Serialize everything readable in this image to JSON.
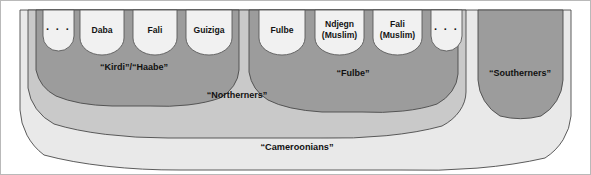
{
  "figure": {
    "kind": "nested-ethnic-identity-diagram",
    "width": 591,
    "height": 175,
    "background": "#ffffff",
    "frame_color": "#b9b9b9"
  },
  "colors": {
    "cameroonians_fill": "#e9e9e9",
    "northerners_fill": "#c9c9c9",
    "kirdi_haabe_fill": "#9c9c9c",
    "fulbe_fill": "#9c9c9c",
    "southerners_fill": "#9c9c9c",
    "cell_fill": "#f1f1f1",
    "outline": "#4a4a4a",
    "text": "#111111"
  },
  "regions": {
    "outer": {
      "label": "“Cameroonians”",
      "level": 1
    },
    "northerners": {
      "label": "“Northerners”",
      "level": 2
    },
    "kirdi_haabe": {
      "label": "“Kirdi”/“Haabe”",
      "level": 3
    },
    "fulbe": {
      "label": "“Fulbe”",
      "level": 3
    },
    "southerners": {
      "label": "“Southerners”",
      "level": 2
    }
  },
  "cells": {
    "kirdi_haabe_groups": [
      {
        "id": "kirdi-ellipsis-left",
        "lines": [
          "· · ·"
        ],
        "is_ellipsis": true
      },
      {
        "id": "kirdi-daba",
        "lines": [
          "Daba"
        ],
        "is_ellipsis": false
      },
      {
        "id": "kirdi-fali",
        "lines": [
          "Fali"
        ],
        "is_ellipsis": false
      },
      {
        "id": "kirdi-guiziga",
        "lines": [
          "Guiziga"
        ],
        "is_ellipsis": false
      }
    ],
    "fulbe_groups": [
      {
        "id": "fulbe-fulbe",
        "lines": [
          "Fulbe"
        ],
        "is_ellipsis": false
      },
      {
        "id": "fulbe-ndjegn",
        "lines": [
          "Ndjegn",
          "(Muslim)"
        ],
        "is_ellipsis": false
      },
      {
        "id": "fulbe-fali",
        "lines": [
          "Fali",
          "(Muslim)"
        ],
        "is_ellipsis": false
      },
      {
        "id": "fulbe-ellipsis-right",
        "lines": [
          "· · ·"
        ],
        "is_ellipsis": true
      }
    ],
    "southerners_groups": []
  }
}
